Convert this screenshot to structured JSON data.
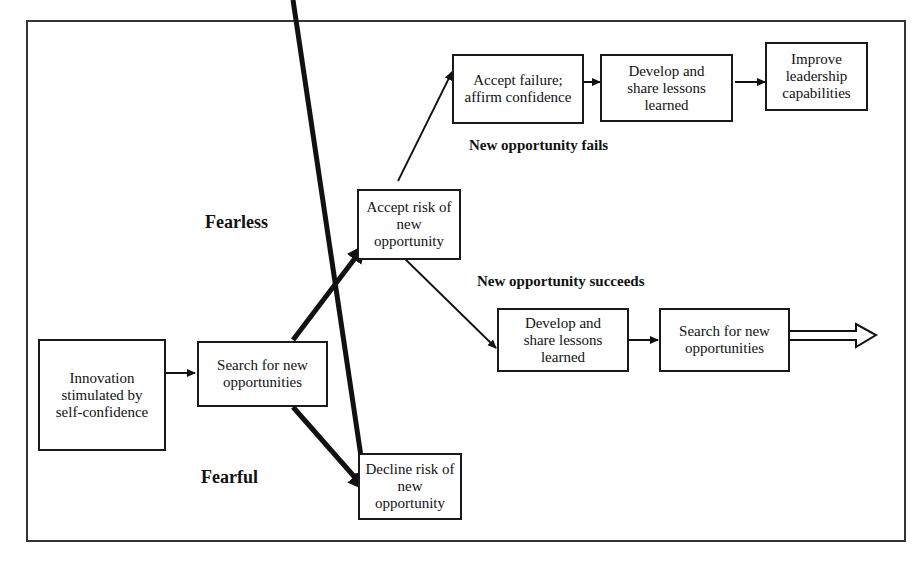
{
  "diagram": {
    "nodes": {
      "innovation": "Innovation stimulated by self-confidence",
      "search_1": "Search for new opportunities",
      "accept_risk": "Accept risk of new opportunity",
      "decline_risk": "Decline risk of new opportunity",
      "accept_failure": "Accept failure; affirm confidence",
      "develop_share_fail": "Develop and share lessons learned",
      "improve_leadership": "Improve leadership capabilities",
      "develop_share_success": "Develop and share lessons learned",
      "search_2": "Search for new opportunities"
    },
    "labels": {
      "fearless": "Fearless",
      "fearful": "Fearful",
      "fails": "New opportunity fails",
      "succeeds": "New opportunity succeeds"
    },
    "edges": [
      {
        "from": "innovation",
        "to": "search_1"
      },
      {
        "from": "search_1",
        "to": "accept_risk",
        "label": "Fearless",
        "weight": "thick"
      },
      {
        "from": "search_1",
        "to": "decline_risk",
        "label": "Fearful",
        "weight": "thick"
      },
      {
        "from": "accept_risk",
        "to": "accept_failure",
        "label": "New opportunity fails"
      },
      {
        "from": "accept_failure",
        "to": "develop_share_fail"
      },
      {
        "from": "develop_share_fail",
        "to": "improve_leadership"
      },
      {
        "from": "accept_risk",
        "to": "develop_share_success",
        "label": "New opportunity succeeds"
      },
      {
        "from": "develop_share_success",
        "to": "search_2"
      },
      {
        "from": "search_2",
        "to": "continue",
        "style": "hollow-arrow"
      }
    ]
  }
}
